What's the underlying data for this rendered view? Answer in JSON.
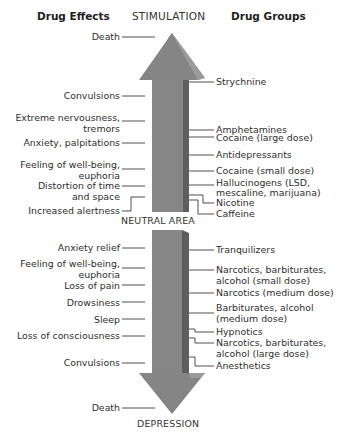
{
  "headers": {
    "left": "Drug Effects",
    "center_top": "STIMULATION",
    "right": "Drug Groups",
    "neutral": "NEUTRAL AREA",
    "center_bottom": "DEPRESSION"
  },
  "colors": {
    "arrow_face": "#858585",
    "arrow_side": "#5e5e5e",
    "arrow_highlight": "#a8a8a8",
    "leader_line": "#3a3a3a",
    "text": "#2e2e2e"
  },
  "effects_stimulation": [
    {
      "text": "Death"
    },
    {
      "text": "Convulsions"
    },
    {
      "text": "Extreme nervousness,",
      "text2": "tremors"
    },
    {
      "text": "Anxiety, palpitations"
    },
    {
      "text": "Feeling of well-being,",
      "text2": "euphoria"
    },
    {
      "text": "Distortion of time",
      "text2": "and space"
    },
    {
      "text": "Increased alertness"
    }
  ],
  "effects_depression": [
    {
      "text": "Anxiety relief"
    },
    {
      "text": "Feeling of well-being,",
      "text2": "euphoria"
    },
    {
      "text": "Loss of pain"
    },
    {
      "text": "Drowsiness"
    },
    {
      "text": "Sleep"
    },
    {
      "text": "Loss of consciousness"
    },
    {
      "text": "Convulsions"
    },
    {
      "text": "Death"
    }
  ],
  "groups_stimulation": [
    {
      "text": "Strychnine"
    },
    {
      "text": "Amphetamines"
    },
    {
      "text": "Cocaine (large dose)"
    },
    {
      "text": "Antidepressants"
    },
    {
      "text": "Cocaine (small dose)"
    },
    {
      "text": "Hallucinogens (LSD,",
      "text2": "mescaline, marijuana)"
    },
    {
      "text": "Nicotine"
    },
    {
      "text": "Caffeine"
    }
  ],
  "groups_depression": [
    {
      "text": "Tranquilizers"
    },
    {
      "text": "Narcotics, barbiturates,",
      "text2": "alcohol (small dose)"
    },
    {
      "text": "Narcotics (medium dose)"
    },
    {
      "text": "Barbiturates, alcohol",
      "text2": "(medium dose)"
    },
    {
      "text": "Hypnotics"
    },
    {
      "text": "Narcotics, barbiturates,",
      "text2": "alcohol (large dose)"
    },
    {
      "text": "Anesthetics"
    }
  ]
}
